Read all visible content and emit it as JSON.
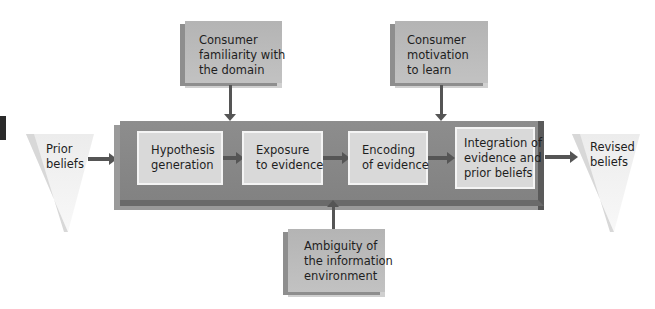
{
  "diagram": {
    "input": {
      "lines": [
        "Prior",
        "beliefs"
      ]
    },
    "output": {
      "lines": [
        "Revised",
        "beliefs"
      ]
    },
    "steps": [
      {
        "lines": [
          "Hypothesis",
          "generation"
        ]
      },
      {
        "lines": [
          "Exposure",
          "to evidence"
        ]
      },
      {
        "lines": [
          "Encoding",
          "of evidence"
        ]
      },
      {
        "lines": [
          "Integration of",
          "evidence and",
          "prior beliefs"
        ]
      }
    ],
    "factors": {
      "familiarity": {
        "lines": [
          "Consumer",
          "familiarity with",
          "the domain"
        ]
      },
      "motivation": {
        "lines": [
          "Consumer",
          "motivation",
          "to learn"
        ]
      },
      "ambiguity": {
        "lines": [
          "Ambiguity of",
          "the information",
          "environment"
        ]
      }
    },
    "colors": {
      "process_band": "#878787",
      "step_box": "#d9d9d9",
      "factor_box": "#bcbcbc",
      "arrow": "#555555",
      "triangle": "#e6e6e6"
    }
  }
}
